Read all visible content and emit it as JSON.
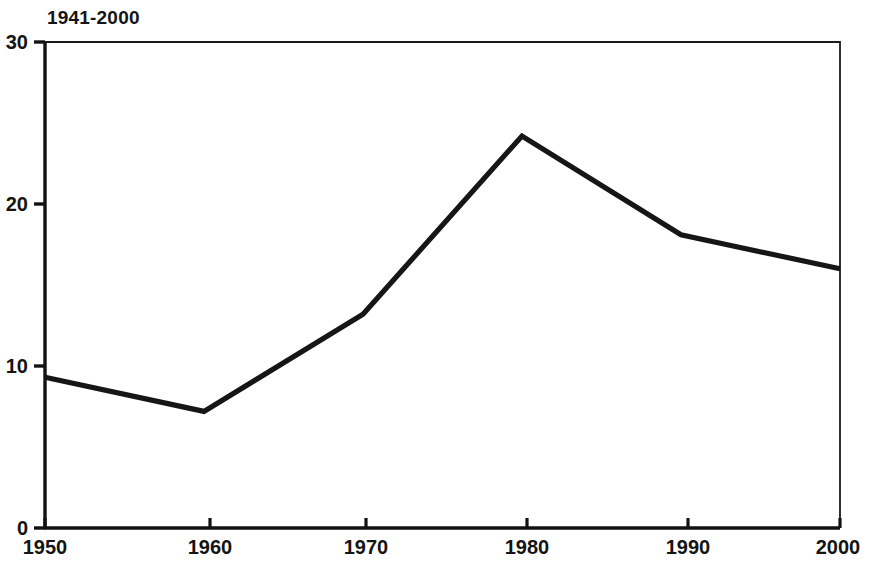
{
  "chart_data": {
    "type": "line",
    "title": "1941-2000",
    "xlabel": "",
    "ylabel": "",
    "x": [
      1950,
      1960,
      1970,
      1980,
      1990,
      2000
    ],
    "categories": [
      "1950",
      "1960",
      "1970",
      "1980",
      "1990",
      "2000"
    ],
    "values": [
      9.3,
      7.2,
      13.2,
      24.2,
      18.1,
      16.0
    ],
    "series": [
      {
        "name": "1941-2000",
        "values": [
          9.3,
          7.2,
          13.2,
          24.2,
          18.1,
          16.0
        ]
      }
    ],
    "xlim": [
      1950,
      2000
    ],
    "ylim": [
      0,
      30
    ],
    "yticks": [
      0,
      10,
      20,
      30
    ],
    "ytick_labels": [
      "0",
      "10",
      "20",
      "30"
    ],
    "xticks": [
      1950,
      1960,
      1970,
      1980,
      1990,
      2000
    ],
    "xtick_labels": [
      "1950",
      "1960",
      "1970",
      "1980",
      "1990",
      "2000"
    ],
    "grid": false,
    "legend": false,
    "legend_position": "none",
    "line_color": "#161616",
    "axis_color": "#111111",
    "background_color": "#ffffff",
    "annotations": []
  },
  "axes": {
    "y_labels": [
      "30",
      "20",
      "10",
      "0"
    ],
    "x_labels": [
      "1950",
      "1960",
      "1970",
      "1980",
      "1990",
      "2000"
    ]
  }
}
